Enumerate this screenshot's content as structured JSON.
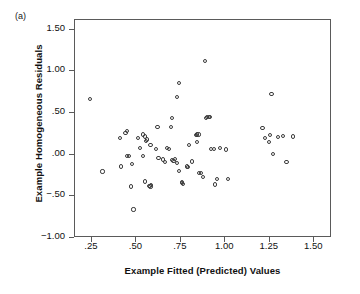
{
  "panel": {
    "label": "(a)"
  },
  "chart_data": {
    "type": "scatter",
    "title": "",
    "xlabel": "Example Fitted (Predicted) Values",
    "ylabel": "Example Homogeneous Residuals",
    "xlim": [
      0.155,
      1.6
    ],
    "ylim": [
      -1.0,
      1.615
    ],
    "grid": false,
    "legend": "none",
    "xticks": [
      0.25,
      0.5,
      0.75,
      1.0,
      1.25,
      1.5
    ],
    "xtick_labels": [
      ".25",
      ".50",
      ".75",
      "1.00",
      "1.25",
      "1.50"
    ],
    "yticks": [
      -1.0,
      -0.5,
      0.0,
      0.5,
      1.0,
      1.5
    ],
    "ytick_labels": [
      "−1.00",
      "−.50",
      ".00",
      ".50",
      "1.00",
      "1.50"
    ],
    "marker": "open-circle",
    "marker_color": "#3b3b3b",
    "n_points": 75,
    "points": [
      [
        0.245,
        0.655
      ],
      [
        0.315,
        -0.215
      ],
      [
        0.445,
        0.245
      ],
      [
        0.455,
        0.27
      ],
      [
        0.455,
        -0.025
      ],
      [
        0.465,
        -0.03
      ],
      [
        0.415,
        0.185
      ],
      [
        0.42,
        -0.155
      ],
      [
        0.48,
        -0.12
      ],
      [
        0.475,
        -0.395
      ],
      [
        0.49,
        -0.67
      ],
      [
        0.515,
        0.19
      ],
      [
        0.545,
        0.23
      ],
      [
        0.555,
        0.205
      ],
      [
        0.56,
        0.15
      ],
      [
        0.565,
        0.17
      ],
      [
        0.525,
        0.07
      ],
      [
        0.585,
        0.1
      ],
      [
        0.545,
        -0.03
      ],
      [
        0.555,
        -0.335
      ],
      [
        0.59,
        -0.375
      ],
      [
        0.615,
        0.06
      ],
      [
        0.625,
        0.32
      ],
      [
        0.63,
        -0.055
      ],
      [
        0.655,
        -0.07
      ],
      [
        0.58,
        -0.385
      ],
      [
        0.585,
        -0.395
      ],
      [
        0.665,
        -0.1
      ],
      [
        0.7,
        0.315
      ],
      [
        0.705,
        0.43
      ],
      [
        0.705,
        -0.08
      ],
      [
        0.715,
        -0.085
      ],
      [
        0.725,
        -0.06
      ],
      [
        0.735,
        -0.115
      ],
      [
        0.68,
        0.065
      ],
      [
        0.69,
        0.06
      ],
      [
        0.745,
        0.85
      ],
      [
        0.735,
        0.68
      ],
      [
        0.745,
        -0.205
      ],
      [
        0.76,
        -0.35
      ],
      [
        0.76,
        -0.345
      ],
      [
        0.77,
        -0.36
      ],
      [
        0.79,
        -0.155
      ],
      [
        0.795,
        -0.165
      ],
      [
        0.8,
        0.1
      ],
      [
        0.82,
        -0.095
      ],
      [
        0.84,
        0.225
      ],
      [
        0.845,
        0.23
      ],
      [
        0.845,
        0.135
      ],
      [
        0.855,
        0.23
      ],
      [
        0.86,
        -0.23
      ],
      [
        0.87,
        -0.235
      ],
      [
        0.88,
        -0.285
      ],
      [
        0.89,
        1.11
      ],
      [
        0.895,
        0.425
      ],
      [
        0.905,
        0.44
      ],
      [
        0.915,
        0.435
      ],
      [
        0.92,
        0.44
      ],
      [
        0.925,
        0.055
      ],
      [
        0.94,
        0.055
      ],
      [
        0.95,
        -0.37
      ],
      [
        0.96,
        -0.3
      ],
      [
        0.975,
        0.065
      ],
      [
        1.01,
        0.05
      ],
      [
        1.02,
        -0.3
      ],
      [
        1.215,
        0.31
      ],
      [
        1.23,
        0.19
      ],
      [
        1.255,
        0.22
      ],
      [
        1.25,
        0.14
      ],
      [
        1.265,
        0.715
      ],
      [
        1.275,
        -0.005
      ],
      [
        1.3,
        0.2
      ],
      [
        1.33,
        0.215
      ],
      [
        1.35,
        -0.105
      ],
      [
        1.385,
        0.205
      ]
    ]
  }
}
